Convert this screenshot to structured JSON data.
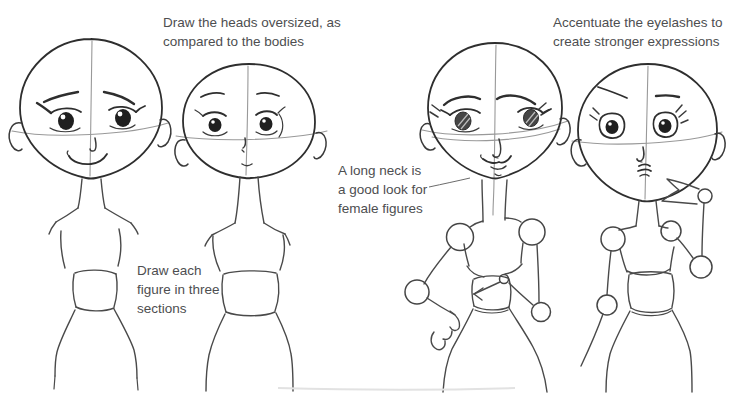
{
  "page_title": "Cartoon female figure drawing tutorial page",
  "colors": {
    "background": "#ffffff",
    "ink": "#2e2e2e",
    "guide_line": "#999999",
    "annotation_text": "#4d4e50"
  },
  "annotations": {
    "heads": {
      "line1": "Draw the heads oversized, as",
      "line2": "compared to the bodies"
    },
    "eyelashes": {
      "line1": "Accentuate the eyelashes to",
      "line2": "create stronger expressions"
    },
    "neck": {
      "line1": "A long neck is",
      "line2": "a good look for",
      "line3": "female figures"
    },
    "sections": {
      "line1": "Draw each",
      "line2": "figure in three",
      "line3": "sections"
    }
  },
  "figures": [
    {
      "name": "sketch-female-confident-large-head"
    },
    {
      "name": "sketch-female-worried-round-head"
    },
    {
      "name": "sketch-female-hand-on-hip-joints"
    },
    {
      "name": "sketch-female-raised-hand-joints"
    }
  ]
}
